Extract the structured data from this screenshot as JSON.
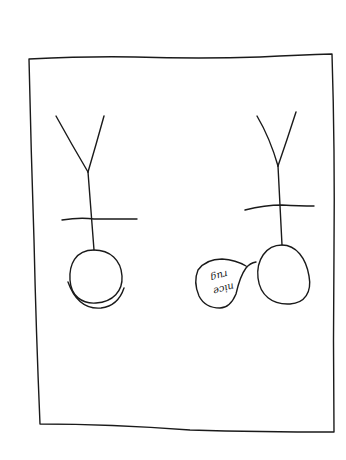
{
  "drawing": {
    "type": "hand-drawn sketch",
    "frame": {
      "shape": "rectangle"
    },
    "figures": [
      {
        "id": "left-figure",
        "description": "Y-shaped stick figure with crossbar above a round head, double arc beneath"
      },
      {
        "id": "right-figure",
        "description": "Y-shaped stick figure with crossbar above an oval head, with a speech bubble"
      }
    ],
    "speech_bubble": {
      "line1": "nice",
      "line2": "rug",
      "orientation": "upside-down"
    },
    "ink_color": "#1a1a1a",
    "background_color": "#ffffff"
  }
}
